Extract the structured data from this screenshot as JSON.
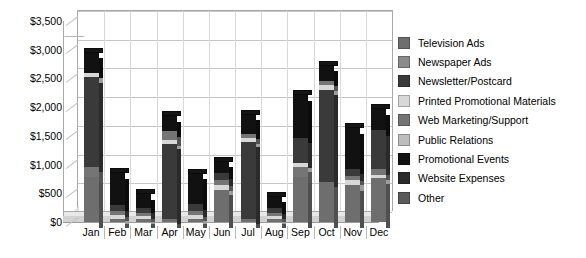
{
  "chart_data": {
    "type": "bar",
    "subtype": "stacked-column-3d",
    "title": "",
    "xlabel": "",
    "ylabel": "",
    "ylim": [
      0,
      3500
    ],
    "ytick_step": 500,
    "ytick_labels": [
      "$0",
      "$500",
      "$1,000",
      "$1,500",
      "$2,000",
      "$2,500",
      "$3,000",
      "$3,500"
    ],
    "ytick_values": [
      0,
      500,
      1000,
      1500,
      2000,
      2500,
      3000,
      3500
    ],
    "grid": true,
    "legend_position": "right",
    "categories": [
      "Jan",
      "Feb",
      "Mar",
      "Apr",
      "May",
      "Jun",
      "Jul",
      "Aug",
      "Sep",
      "Oct",
      "Nov",
      "Dec"
    ],
    "series": [
      {
        "name": "Television Ads",
        "color": "#6e6e6e",
        "values": [
          780,
          60,
          60,
          60,
          60,
          560,
          60,
          60,
          780,
          700,
          640,
          760
        ]
      },
      {
        "name": "Newspaper Ads",
        "color": "#8a8a8a",
        "values": [
          0,
          0,
          0,
          0,
          0,
          0,
          0,
          0,
          0,
          0,
          0,
          0
        ]
      },
      {
        "name": "Newsletter/Postcard",
        "color": "#3a3a3a",
        "values": [
          1560,
          100,
          100,
          1300,
          120,
          120,
          1340,
          90,
          440,
          1600,
          120,
          680
        ]
      },
      {
        "name": "Printed Promotional Materials",
        "color": "#d8d8d8",
        "values": [
          80,
          60,
          40,
          60,
          60,
          80,
          60,
          40,
          70,
          80,
          100,
          60
        ]
      },
      {
        "name": "Web Marketing/Support",
        "color": "#757575",
        "values": [
          180,
          70,
          50,
          160,
          70,
          90,
          80,
          50,
          180,
          80,
          70,
          100
        ]
      },
      {
        "name": "Public Relations",
        "color": "#bdbdbd",
        "values": [
          0,
          0,
          0,
          0,
          0,
          0,
          0,
          0,
          0,
          0,
          0,
          0
        ]
      },
      {
        "name": "Promotional Events",
        "color": "#111111",
        "values": [
          350,
          560,
          230,
          260,
          530,
          200,
          330,
          200,
          740,
          260,
          700,
          360
        ]
      },
      {
        "name": "Website Expenses",
        "color": "#2b2b2b",
        "values": [
          0,
          0,
          0,
          0,
          0,
          0,
          0,
          0,
          0,
          0,
          0,
          0
        ]
      },
      {
        "name": "Other",
        "color": "#5a5a5a",
        "values": [
          0,
          0,
          0,
          0,
          0,
          0,
          0,
          0,
          0,
          0,
          0,
          0
        ]
      }
    ],
    "totals": [
      2950,
      850,
      480,
      1840,
      840,
      1050,
      1870,
      440,
      2210,
      2720,
      1630,
      1960
    ]
  },
  "axes": {
    "y_labels": [
      "$3,500",
      "$3,000",
      "$2,500",
      "$2,000",
      "$1,500",
      "$1,000",
      "$500",
      "$0"
    ],
    "x_labels": [
      "Jan",
      "Feb",
      "Mar",
      "Apr",
      "May",
      "Jun",
      "Jul",
      "Aug",
      "Sep",
      "Oct",
      "Nov",
      "Dec"
    ]
  },
  "legend": {
    "items": [
      {
        "label": "Television Ads",
        "color": "#6e6e6e"
      },
      {
        "label": "Newspaper Ads",
        "color": "#8a8a8a"
      },
      {
        "label": "Newsletter/Postcard",
        "color": "#3a3a3a"
      },
      {
        "label": "Printed Promotional Materials",
        "color": "#d8d8d8"
      },
      {
        "label": "Web Marketing/Support",
        "color": "#757575"
      },
      {
        "label": "Public Relations",
        "color": "#bdbdbd"
      },
      {
        "label": "Promotional Events",
        "color": "#111111"
      },
      {
        "label": "Website Expenses",
        "color": "#2b2b2b"
      },
      {
        "label": "Other",
        "color": "#5a5a5a"
      }
    ]
  },
  "bar_stacks": [
    {
      "month": "Jan",
      "segments": [
        {
          "series": "Television Ads",
          "value": 780
        },
        {
          "series": "Web Marketing/Support",
          "value": 180
        },
        {
          "series": "Newsletter/Postcard",
          "value": 1560
        },
        {
          "series": "Printed Promotional Materials",
          "value": 80
        },
        {
          "series": "Web Marketing/Support",
          "value": 0
        },
        {
          "series": "Promotional Events",
          "value": 350
        }
      ],
      "total": 2950
    },
    {
      "month": "Feb",
      "segments": [
        {
          "series": "Television Ads",
          "value": 60
        },
        {
          "series": "Printed Promotional Materials",
          "value": 60
        },
        {
          "series": "Web Marketing/Support",
          "value": 70
        },
        {
          "series": "Newsletter/Postcard",
          "value": 100
        },
        {
          "series": "Promotional Events",
          "value": 560
        }
      ],
      "total": 850
    },
    {
      "month": "Mar",
      "segments": [
        {
          "series": "Television Ads",
          "value": 60
        },
        {
          "series": "Printed Promotional Materials",
          "value": 40
        },
        {
          "series": "Web Marketing/Support",
          "value": 50
        },
        {
          "series": "Newsletter/Postcard",
          "value": 100
        },
        {
          "series": "Promotional Events",
          "value": 230
        }
      ],
      "total": 480
    },
    {
      "month": "Apr",
      "segments": [
        {
          "series": "Television Ads",
          "value": 60
        },
        {
          "series": "Newsletter/Postcard",
          "value": 1300
        },
        {
          "series": "Printed Promotional Materials",
          "value": 60
        },
        {
          "series": "Web Marketing/Support",
          "value": 160
        },
        {
          "series": "Promotional Events",
          "value": 260
        }
      ],
      "total": 1840
    },
    {
      "month": "May",
      "segments": [
        {
          "series": "Television Ads",
          "value": 60
        },
        {
          "series": "Printed Promotional Materials",
          "value": 60
        },
        {
          "series": "Web Marketing/Support",
          "value": 70
        },
        {
          "series": "Newsletter/Postcard",
          "value": 120
        },
        {
          "series": "Promotional Events",
          "value": 530
        }
      ],
      "total": 840
    },
    {
      "month": "Jun",
      "segments": [
        {
          "series": "Television Ads",
          "value": 560
        },
        {
          "series": "Printed Promotional Materials",
          "value": 80
        },
        {
          "series": "Web Marketing/Support",
          "value": 90
        },
        {
          "series": "Newsletter/Postcard",
          "value": 120
        },
        {
          "series": "Promotional Events",
          "value": 200
        }
      ],
      "total": 1050
    },
    {
      "month": "Jul",
      "segments": [
        {
          "series": "Television Ads",
          "value": 60
        },
        {
          "series": "Newsletter/Postcard",
          "value": 1340
        },
        {
          "series": "Printed Promotional Materials",
          "value": 60
        },
        {
          "series": "Web Marketing/Support",
          "value": 80
        },
        {
          "series": "Promotional Events",
          "value": 330
        }
      ],
      "total": 1870
    },
    {
      "month": "Aug",
      "segments": [
        {
          "series": "Television Ads",
          "value": 60
        },
        {
          "series": "Printed Promotional Materials",
          "value": 40
        },
        {
          "series": "Web Marketing/Support",
          "value": 50
        },
        {
          "series": "Newsletter/Postcard",
          "value": 90
        },
        {
          "series": "Promotional Events",
          "value": 200
        }
      ],
      "total": 440
    },
    {
      "month": "Sep",
      "segments": [
        {
          "series": "Television Ads",
          "value": 780
        },
        {
          "series": "Web Marketing/Support",
          "value": 180
        },
        {
          "series": "Printed Promotional Materials",
          "value": 70
        },
        {
          "series": "Newsletter/Postcard",
          "value": 440
        },
        {
          "series": "Promotional Events",
          "value": 740
        }
      ],
      "total": 2210
    },
    {
      "month": "Oct",
      "segments": [
        {
          "series": "Television Ads",
          "value": 700
        },
        {
          "series": "Newsletter/Postcard",
          "value": 1600
        },
        {
          "series": "Printed Promotional Materials",
          "value": 80
        },
        {
          "series": "Web Marketing/Support",
          "value": 80
        },
        {
          "series": "Promotional Events",
          "value": 260
        }
      ],
      "total": 2720
    },
    {
      "month": "Nov",
      "segments": [
        {
          "series": "Television Ads",
          "value": 640
        },
        {
          "series": "Printed Promotional Materials",
          "value": 100
        },
        {
          "series": "Web Marketing/Support",
          "value": 70
        },
        {
          "series": "Newsletter/Postcard",
          "value": 120
        },
        {
          "series": "Promotional Events",
          "value": 700
        }
      ],
      "total": 1630
    },
    {
      "month": "Dec",
      "segments": [
        {
          "series": "Television Ads",
          "value": 760
        },
        {
          "series": "Printed Promotional Materials",
          "value": 60
        },
        {
          "series": "Web Marketing/Support",
          "value": 100
        },
        {
          "series": "Newsletter/Postcard",
          "value": 680
        },
        {
          "series": "Promotional Events",
          "value": 360
        }
      ],
      "total": 1960
    }
  ]
}
